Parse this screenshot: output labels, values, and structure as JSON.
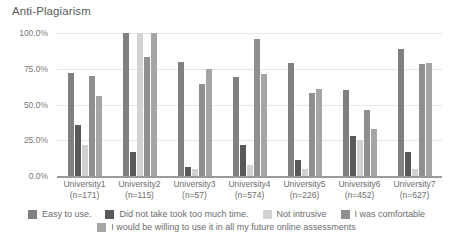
{
  "chart_data": {
    "type": "bar",
    "title": "Anti-Plagiarism",
    "xlabel": "",
    "ylabel": "",
    "ylim": [
      0,
      100
    ],
    "grid": true,
    "legend_position": "bottom",
    "ytick_labels": [
      "100.0%",
      "75.0%",
      "50.0%",
      "25.0%",
      "0.0%"
    ],
    "ytick_values": [
      100,
      75,
      50,
      25,
      0
    ],
    "categories": [
      "University1\n(n=171)",
      "University2\n(n=115)",
      "University3\n(n=57)",
      "University4\n(n=574)",
      "University5\n(n=226)",
      "University6\n(n=452)",
      "University7\n(n=627)"
    ],
    "category_names": [
      "University1",
      "University2",
      "University3",
      "University4",
      "University5",
      "University6",
      "University7"
    ],
    "category_counts": [
      "(n=171)",
      "(n=115)",
      "(n=57)",
      "(n=574)",
      "(n=226)",
      "(n=452)",
      "(n=627)"
    ],
    "series": [
      {
        "name": "Easy to use.",
        "color": "#808080",
        "values": [
          72,
          100,
          80,
          69,
          79,
          60,
          89
        ]
      },
      {
        "name": "Did not take took too much time.",
        "color": "#595959",
        "values": [
          36,
          17,
          6,
          22,
          11,
          28,
          17
        ]
      },
      {
        "name": "Not intrusive",
        "color": "#d2d2d2",
        "values": [
          22,
          100,
          5,
          8,
          5,
          25,
          5
        ]
      },
      {
        "name": "I was comfortable",
        "color": "#8f8f8f",
        "values": [
          70,
          83,
          64,
          96,
          58,
          46,
          78
        ]
      },
      {
        "name": "I would be willing to use it in all my future online assessments",
        "color": "#a5a5a5",
        "values": [
          56,
          100,
          75,
          71,
          61,
          33,
          79
        ]
      }
    ]
  },
  "legend": {
    "row1": [
      "Easy to use.",
      "Did not take took too much time.",
      "Not intrusive",
      "I was comfortable"
    ],
    "row2": [
      "I would be willing to use it in all my future online assessments"
    ]
  }
}
